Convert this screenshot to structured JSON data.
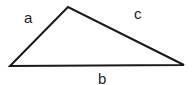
{
  "diagram": {
    "vertices": {
      "left": [
        10,
        66
      ],
      "top": [
        68,
        7
      ],
      "right": [
        184,
        65
      ]
    },
    "sides": [
      {
        "name": "a",
        "label": "a",
        "from": "left",
        "to": "top",
        "label_pos": [
          24,
          23
        ]
      },
      {
        "name": "c",
        "label": "c",
        "from": "top",
        "to": "right",
        "label_pos": [
          134,
          19
        ]
      },
      {
        "name": "b",
        "label": "b",
        "from": "left",
        "to": "right",
        "label_pos": [
          98,
          84
        ]
      }
    ],
    "stroke_color": "#1a1a1a",
    "label_color": "#222222"
  }
}
